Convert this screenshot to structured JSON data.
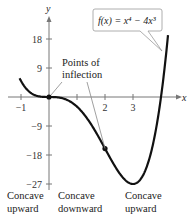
{
  "chart_data": {
    "type": "line",
    "title": "",
    "function_label": "f(x) = x⁴ − 4x³",
    "xlabel": "x",
    "ylabel": "y",
    "xlim": [
      -1.4,
      4.3
    ],
    "ylim": [
      -30,
      24
    ],
    "x_ticks": [
      -1,
      1,
      2,
      3
    ],
    "x_tick_labels": [
      "−1",
      "",
      "2",
      "3"
    ],
    "y_ticks": [
      18,
      9,
      -9,
      -18,
      -27
    ],
    "y_tick_labels": [
      "18",
      "9",
      "−9",
      "−18",
      "−27"
    ],
    "series": [
      {
        "name": "f(x) = x^4 - 4x^3",
        "x_range": [
          -1.05,
          4.25
        ]
      }
    ],
    "inflection_points": [
      {
        "x": 0,
        "y": 0
      },
      {
        "x": 2,
        "y": -16
      }
    ],
    "annotations": {
      "points_of_inflection": [
        "Points of",
        "inflection"
      ],
      "concave_upward_left": [
        "Concave",
        "upward"
      ],
      "concave_downward": [
        "Concave",
        "downward"
      ],
      "concave_upward_right": [
        "Concave",
        "upward"
      ]
    },
    "grid": false
  }
}
